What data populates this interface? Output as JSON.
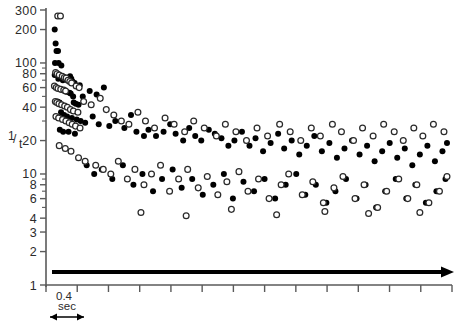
{
  "figure": {
    "title": "",
    "background": "#ffffff",
    "width": 458,
    "height": 321
  },
  "axes": {
    "y": {
      "label_numerator": "1",
      "label_denominator": "t",
      "label_slash": "/",
      "scale": "log",
      "range": [
        1,
        300
      ],
      "tick_labels": [
        "300",
        "200",
        "100",
        "80",
        "60",
        "40",
        "20",
        "10",
        "8",
        "6",
        "4",
        "3",
        "2",
        "1"
      ],
      "tick_values": [
        300,
        200,
        100,
        80,
        60,
        40,
        20,
        10,
        8,
        6,
        4,
        3,
        2,
        1
      ]
    },
    "x": {
      "label": "",
      "scale_bar_value": "0.4",
      "scale_bar_unit": "sec",
      "tick_count": 14,
      "ticks_unlabeled": true
    }
  },
  "annotations": {
    "stimulus_arrow": "stimulus-duration-arrow",
    "scale_bar": "0.4 sec"
  },
  "colors": {
    "filled_marker": "#000000",
    "open_marker_stroke": "#2a2a2a",
    "open_marker_fill": "#ffffff",
    "axis": "#5a5a5a",
    "annotation": "#000000"
  },
  "chart_data": {
    "type": "scatter",
    "title": "",
    "xlabel": "",
    "ylabel": "1/t",
    "xscale": "linear",
    "yscale": "log",
    "ylim": [
      1,
      300
    ],
    "xlim": [
      0,
      13.2
    ],
    "grid": false,
    "legend": "none",
    "x_unit": "sec",
    "x_tick_interval_sec": 0.4,
    "series": [
      {
        "name": "filled-circles",
        "marker": "filled circle",
        "color": "#000000",
        "points": [
          [
            0.09,
            200
          ],
          [
            0.12,
            150
          ],
          [
            0.15,
            128
          ],
          [
            0.2,
            128
          ],
          [
            0.1,
            100
          ],
          [
            0.22,
            100
          ],
          [
            0.31,
            95
          ],
          [
            0.09,
            78
          ],
          [
            0.21,
            72
          ],
          [
            0.3,
            74
          ],
          [
            0.36,
            70
          ],
          [
            0.44,
            72
          ],
          [
            0.52,
            70
          ],
          [
            0.56,
            74
          ],
          [
            0.6,
            76
          ],
          [
            0.64,
            72
          ],
          [
            0.68,
            68
          ],
          [
            0.75,
            66
          ],
          [
            0.85,
            62
          ],
          [
            0.92,
            63
          ],
          [
            0.27,
            58
          ],
          [
            0.33,
            57
          ],
          [
            0.38,
            57
          ],
          [
            0.43,
            56
          ],
          [
            0.48,
            55
          ],
          [
            0.58,
            54
          ],
          [
            0.62,
            53
          ],
          [
            0.7,
            50
          ],
          [
            1.02,
            50
          ],
          [
            0.18,
            45
          ],
          [
            0.25,
            44
          ],
          [
            0.72,
            44
          ],
          [
            0.79,
            43
          ],
          [
            0.88,
            42
          ],
          [
            1.25,
            56
          ],
          [
            1.48,
            52
          ],
          [
            1.72,
            60
          ],
          [
            0.3,
            36
          ],
          [
            0.4,
            34
          ],
          [
            0.5,
            33
          ],
          [
            0.66,
            32
          ],
          [
            0.82,
            31
          ],
          [
            0.95,
            30
          ],
          [
            1.1,
            29
          ],
          [
            1.35,
            33
          ],
          [
            0.26,
            25
          ],
          [
            0.37,
            24
          ],
          [
            0.55,
            24
          ],
          [
            0.76,
            23
          ],
          [
            1.55,
            28
          ],
          [
            1.9,
            27
          ],
          [
            2.1,
            30
          ],
          [
            2.4,
            26
          ],
          [
            2.62,
            34
          ],
          [
            2.8,
            24
          ],
          [
            3.05,
            22
          ],
          [
            3.2,
            25
          ],
          [
            3.45,
            22
          ],
          [
            3.7,
            24
          ],
          [
            3.92,
            28
          ],
          [
            4.1,
            23
          ],
          [
            4.35,
            20
          ],
          [
            4.55,
            26
          ],
          [
            4.75,
            22
          ],
          [
            4.95,
            20
          ],
          [
            5.2,
            25
          ],
          [
            5.4,
            23
          ],
          [
            5.62,
            21
          ],
          [
            5.85,
            18
          ],
          [
            6.05,
            20
          ],
          [
            6.3,
            24
          ],
          [
            6.55,
            18
          ],
          [
            6.75,
            21
          ],
          [
            7.0,
            16
          ],
          [
            7.25,
            19
          ],
          [
            7.5,
            23
          ],
          [
            7.7,
            17
          ],
          [
            7.95,
            20
          ],
          [
            8.2,
            15
          ],
          [
            8.45,
            18
          ],
          [
            8.7,
            22
          ],
          [
            8.95,
            16
          ],
          [
            9.2,
            19
          ],
          [
            9.45,
            14
          ],
          [
            9.7,
            17
          ],
          [
            9.95,
            20
          ],
          [
            10.2,
            15
          ],
          [
            10.45,
            18
          ],
          [
            10.7,
            13
          ],
          [
            10.95,
            16
          ],
          [
            11.2,
            19
          ],
          [
            11.45,
            14
          ],
          [
            11.7,
            17
          ],
          [
            11.95,
            12
          ],
          [
            12.2,
            15
          ],
          [
            12.45,
            18
          ],
          [
            12.7,
            13
          ],
          [
            12.95,
            16
          ],
          [
            13.1,
            19
          ],
          [
            1.15,
            12
          ],
          [
            1.4,
            10
          ],
          [
            1.65,
            11
          ],
          [
            2.0,
            9
          ],
          [
            2.35,
            12
          ],
          [
            2.7,
            8
          ],
          [
            3.0,
            10
          ],
          [
            3.35,
            7
          ],
          [
            3.65,
            9
          ],
          [
            4.0,
            11
          ],
          [
            4.3,
            7.5
          ],
          [
            4.65,
            9
          ],
          [
            5.0,
            6.5
          ],
          [
            5.35,
            8
          ],
          [
            5.7,
            10
          ],
          [
            6.0,
            6
          ],
          [
            6.35,
            8.5
          ],
          [
            6.7,
            7
          ],
          [
            7.05,
            9
          ],
          [
            7.4,
            6
          ],
          [
            7.75,
            8
          ],
          [
            8.1,
            10
          ],
          [
            8.4,
            6.5
          ],
          [
            8.75,
            8
          ],
          [
            9.1,
            5.5
          ],
          [
            9.4,
            7
          ],
          [
            9.75,
            9
          ],
          [
            10.1,
            6
          ],
          [
            10.4,
            8
          ],
          [
            10.75,
            5
          ],
          [
            11.05,
            7
          ],
          [
            11.4,
            9
          ],
          [
            11.75,
            6
          ],
          [
            12.05,
            8
          ],
          [
            12.4,
            5.5
          ],
          [
            12.75,
            7
          ],
          [
            13.05,
            9
          ]
        ]
      },
      {
        "name": "open-circles",
        "marker": "open circle",
        "color": "#ffffff",
        "points": [
          [
            0.19,
            265
          ],
          [
            0.28,
            265
          ],
          [
            0.12,
            82
          ],
          [
            0.17,
            80
          ],
          [
            0.24,
            78
          ],
          [
            0.34,
            76
          ],
          [
            0.41,
            74
          ],
          [
            0.47,
            73
          ],
          [
            0.08,
            62
          ],
          [
            0.14,
            60
          ],
          [
            0.2,
            59
          ],
          [
            0.29,
            58
          ],
          [
            0.39,
            57
          ],
          [
            0.45,
            56
          ],
          [
            0.53,
            70
          ],
          [
            0.59,
            68
          ],
          [
            0.65,
            66
          ],
          [
            0.8,
            62
          ],
          [
            0.9,
            60
          ],
          [
            0.11,
            45
          ],
          [
            0.16,
            44
          ],
          [
            0.23,
            43
          ],
          [
            0.32,
            42
          ],
          [
            0.42,
            41
          ],
          [
            0.51,
            40
          ],
          [
            0.61,
            38
          ],
          [
            0.71,
            37
          ],
          [
            0.86,
            36
          ],
          [
            1.05,
            45
          ],
          [
            1.3,
            42
          ],
          [
            1.6,
            48
          ],
          [
            0.13,
            33
          ],
          [
            0.22,
            32
          ],
          [
            0.35,
            31
          ],
          [
            0.46,
            30
          ],
          [
            0.57,
            29
          ],
          [
            0.67,
            28
          ],
          [
            0.78,
            27
          ],
          [
            0.93,
            26
          ],
          [
            1.8,
            38
          ],
          [
            2.05,
            34
          ],
          [
            2.3,
            30
          ],
          [
            2.55,
            28
          ],
          [
            2.85,
            36
          ],
          [
            3.1,
            30
          ],
          [
            3.4,
            26
          ],
          [
            3.75,
            32
          ],
          [
            4.05,
            28
          ],
          [
            4.4,
            24
          ],
          [
            4.7,
            30
          ],
          [
            5.05,
            26
          ],
          [
            5.45,
            22
          ],
          [
            5.75,
            28
          ],
          [
            6.1,
            24
          ],
          [
            6.45,
            20
          ],
          [
            6.8,
            26
          ],
          [
            7.15,
            22
          ],
          [
            7.55,
            28
          ],
          [
            7.9,
            24
          ],
          [
            8.25,
            20
          ],
          [
            8.6,
            26
          ],
          [
            8.9,
            22
          ],
          [
            9.3,
            28
          ],
          [
            9.6,
            24
          ],
          [
            10.0,
            20
          ],
          [
            10.3,
            26
          ],
          [
            10.65,
            22
          ],
          [
            11.0,
            28
          ],
          [
            11.35,
            24
          ],
          [
            11.65,
            20
          ],
          [
            12.0,
            26
          ],
          [
            12.3,
            22
          ],
          [
            12.65,
            28
          ],
          [
            13.0,
            24
          ],
          [
            0.24,
            18
          ],
          [
            0.44,
            17
          ],
          [
            0.63,
            16
          ],
          [
            0.88,
            14
          ],
          [
            1.1,
            13
          ],
          [
            1.45,
            12
          ],
          [
            1.7,
            11
          ],
          [
            1.95,
            10
          ],
          [
            2.2,
            13
          ],
          [
            2.5,
            9
          ],
          [
            2.75,
            11
          ],
          [
            3.05,
            8
          ],
          [
            3.3,
            10
          ],
          [
            3.6,
            12
          ],
          [
            3.9,
            7
          ],
          [
            4.2,
            9
          ],
          [
            4.5,
            11
          ],
          [
            4.85,
            7.5
          ],
          [
            5.15,
            9.5
          ],
          [
            5.5,
            6.5
          ],
          [
            5.8,
            8.5
          ],
          [
            6.2,
            10.5
          ],
          [
            6.5,
            7
          ],
          [
            6.85,
            9
          ],
          [
            7.2,
            6
          ],
          [
            7.6,
            8
          ],
          [
            7.85,
            10
          ],
          [
            8.3,
            6.5
          ],
          [
            8.65,
            8.5
          ],
          [
            9.0,
            5.5
          ],
          [
            9.35,
            7.5
          ],
          [
            9.65,
            9.5
          ],
          [
            10.05,
            6
          ],
          [
            10.35,
            8
          ],
          [
            10.8,
            5
          ],
          [
            11.1,
            7
          ],
          [
            11.5,
            9
          ],
          [
            11.8,
            6
          ],
          [
            12.1,
            8
          ],
          [
            12.5,
            5.5
          ],
          [
            12.85,
            7
          ],
          [
            13.1,
            9.5
          ],
          [
            2.95,
            4.5
          ],
          [
            4.45,
            4.2
          ],
          [
            5.95,
            4.8
          ],
          [
            7.45,
            4.3
          ],
          [
            9.05,
            4.6
          ],
          [
            10.5,
            4.4
          ],
          [
            12.2,
            4.5
          ]
        ]
      }
    ]
  }
}
